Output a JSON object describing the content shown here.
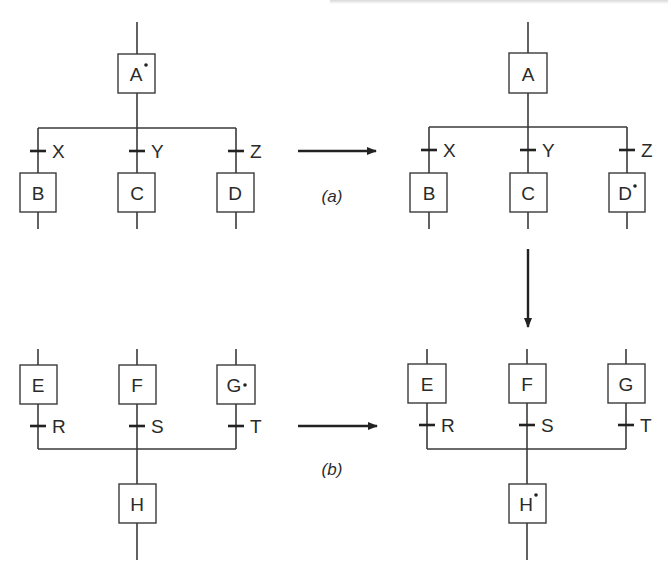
{
  "figure": {
    "panels": [
      {
        "id": "a",
        "caption": "(a)",
        "before": {
          "top_node": {
            "label": "A",
            "marked": true
          },
          "branches": [
            {
              "transition": "X",
              "node": {
                "label": "B",
                "marked": false
              }
            },
            {
              "transition": "Y",
              "node": {
                "label": "C",
                "marked": false
              }
            },
            {
              "transition": "Z",
              "node": {
                "label": "D",
                "marked": false
              }
            }
          ]
        },
        "after": {
          "top_node": {
            "label": "A",
            "marked": false
          },
          "branches": [
            {
              "transition": "X",
              "node": {
                "label": "B",
                "marked": false
              }
            },
            {
              "transition": "Y",
              "node": {
                "label": "C",
                "marked": false
              }
            },
            {
              "transition": "Z",
              "node": {
                "label": "D",
                "marked": true
              }
            }
          ]
        }
      },
      {
        "id": "b",
        "caption": "(b)",
        "before": {
          "branches": [
            {
              "node": {
                "label": "E",
                "marked": false
              },
              "transition": "R"
            },
            {
              "node": {
                "label": "F",
                "marked": false
              },
              "transition": "S"
            },
            {
              "node": {
                "label": "G",
                "marked": true
              },
              "transition": "T"
            }
          ],
          "bottom_node": {
            "label": "H",
            "marked": false
          }
        },
        "after": {
          "branches": [
            {
              "node": {
                "label": "E",
                "marked": false
              },
              "transition": "R"
            },
            {
              "node": {
                "label": "F",
                "marked": false
              },
              "transition": "S"
            },
            {
              "node": {
                "label": "G",
                "marked": false
              },
              "transition": "T"
            }
          ],
          "bottom_node": {
            "label": "H",
            "marked": true
          }
        }
      }
    ],
    "colors": {
      "line": "#3a3a3a",
      "text": "#2a2a2a",
      "background": "#ffffff"
    }
  }
}
